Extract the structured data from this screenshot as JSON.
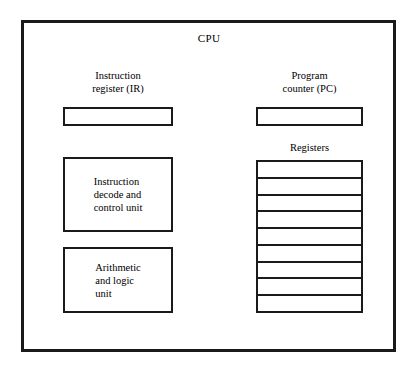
{
  "diagram": {
    "title": "CPU",
    "left_column": {
      "instruction_register": {
        "caption_line1": "Instruction",
        "caption_line2": "register (IR)"
      },
      "decode_unit": {
        "label": "Instruction\ndecode and\ncontrol unit"
      },
      "alu": {
        "label": "Arithmetic\nand logic\nunit"
      }
    },
    "right_column": {
      "program_counter": {
        "caption_line1": "Program",
        "caption_line2": "counter (PC)"
      },
      "registers": {
        "caption": "Registers",
        "cell_count": 9
      }
    }
  },
  "colors": {
    "stroke": "#1a1a1a",
    "background": "#ffffff"
  }
}
